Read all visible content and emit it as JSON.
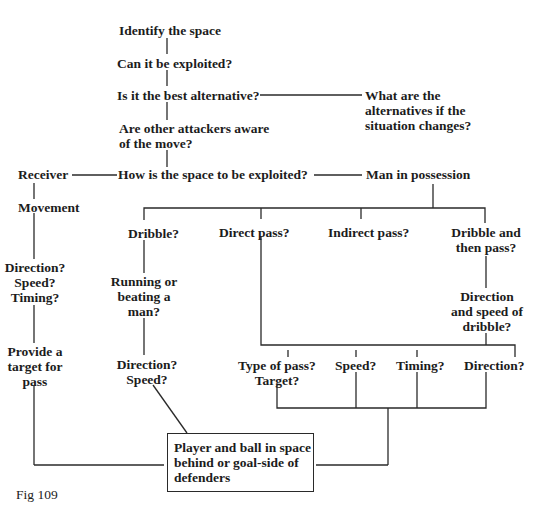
{
  "figure": {
    "caption": "Fig 109"
  },
  "nodes": {
    "identify": "Identify the space",
    "exploited": "Can it be exploited?",
    "best_alt": "Is it the best alternative?",
    "alternatives": [
      "What are the",
      "alternatives if the",
      "situation changes?"
    ],
    "aware": [
      "Are other attackers aware",
      "of the move?"
    ],
    "how": "How is the space to be exploited?",
    "receiver": "Receiver",
    "man_possession": "Man in possession",
    "movement": "Movement",
    "recv_dst": [
      "Direction?",
      "Speed?",
      "Timing?"
    ],
    "provide_target": [
      "Provide a",
      "target for",
      "pass"
    ],
    "dribble": "Dribble?",
    "direct_pass": "Direct pass?",
    "indirect_pass": "Indirect pass?",
    "dribble_then_pass": [
      "Dribble and",
      "then pass?"
    ],
    "running": [
      "Running or",
      "beating a",
      "man?"
    ],
    "dribble_dir_speed": [
      "Direction?",
      "Speed?"
    ],
    "dir_speed_dribble": [
      "Direction",
      "and speed of",
      "dribble?"
    ],
    "type_of_pass": [
      "Type of pass?",
      "Target?"
    ],
    "speed": "Speed?",
    "timing": "Timing?",
    "direction": "Direction?",
    "outcome": [
      "Player and ball in space",
      "behind or goal-side of",
      "defenders"
    ]
  },
  "colors": {
    "ink": "#1c1c1c",
    "background": "#ffffff"
  }
}
